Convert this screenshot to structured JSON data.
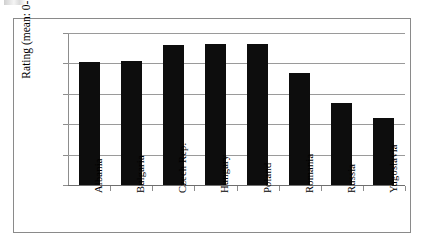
{
  "chart_data": {
    "type": "bar",
    "title": "",
    "xlabel": "",
    "ylabel": "Rating (mean: 0-10)",
    "ylim": [
      0,
      10
    ],
    "ytick_labels": [
      "0",
      "2",
      "4",
      "6",
      "8",
      "10"
    ],
    "yticks": [
      0,
      2,
      4,
      6,
      8,
      10
    ],
    "grid": true,
    "legend": false,
    "bar_color": "#0d0d0d",
    "categories": [
      "Albania",
      "Bulgaria",
      "Czech Rep.",
      "Hungary",
      "Poland",
      "Romania",
      "Russia",
      "Yugoslavia"
    ],
    "values": [
      8.1,
      8.15,
      9.2,
      9.25,
      9.3,
      7.4,
      5.4,
      4.4
    ]
  },
  "axes": {
    "y_axis_title": "Rating (mean: 0-10)"
  }
}
